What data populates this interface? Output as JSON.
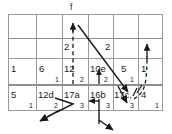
{
  "diagram": {
    "title": "f",
    "grid": {
      "columns": 6,
      "rows": 3,
      "x_lines": [
        8,
        36,
        62,
        88,
        113,
        138,
        163
      ],
      "y_lines": [
        14,
        39,
        58,
        85,
        111
      ]
    },
    "function_label": "f",
    "rows": [
      {
        "name": "row-top",
        "cells": [
          {
            "main": "",
            "corner": ""
          },
          {
            "main": "",
            "corner": ""
          },
          {
            "main": "",
            "corner": ""
          },
          {
            "main": "",
            "corner": ""
          },
          {
            "main": "",
            "corner": ""
          },
          {
            "main": "",
            "corner": ""
          }
        ]
      },
      {
        "name": "row-arrow-labels",
        "cells": [
          {
            "main": "",
            "corner": ""
          },
          {
            "main": "",
            "corner": ""
          },
          {
            "main": "2",
            "corner": ""
          },
          {
            "main": "2",
            "corner": ""
          },
          {
            "main": "",
            "corner": ""
          },
          {
            "main": "",
            "corner": ""
          }
        ]
      },
      {
        "name": "row-middle",
        "cells": [
          {
            "main": "1",
            "corner": ""
          },
          {
            "main": "6",
            "corner": "1"
          },
          {
            "main": "12",
            "corner": "2"
          },
          {
            "main": "10e",
            "corner": "2"
          },
          {
            "main": "5",
            "corner": "1"
          },
          {
            "main": "1",
            "corner": ""
          }
        ]
      },
      {
        "name": "row-bottom",
        "cells": [
          {
            "main": "5",
            "corner": "1"
          },
          {
            "main": "12d",
            "corner": "2"
          },
          {
            "main": "17a",
            "corner": "3"
          },
          {
            "main": "16b",
            "corner": "3"
          },
          {
            "main": "17c,",
            "corner": "3"
          },
          {
            "main": "4",
            "corner": "1"
          }
        ]
      }
    ],
    "arrow_labels": [
      {
        "text": "2",
        "x": 64,
        "y": 47
      },
      {
        "text": "2",
        "x": 105,
        "y": 47
      }
    ],
    "colors": {
      "grid_line": "#9a9a9a",
      "grid_line_strong": "#8a8a8a",
      "stroke": "#1a1a1a",
      "text": "#1a1a1a",
      "background": "#ffffff"
    }
  }
}
